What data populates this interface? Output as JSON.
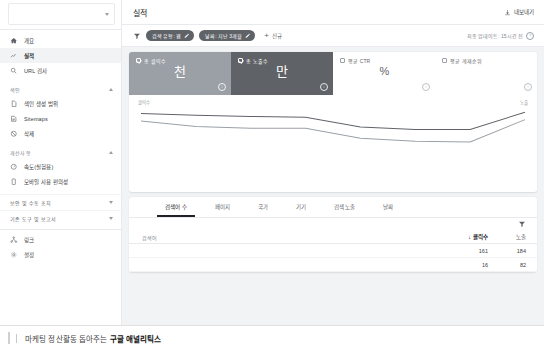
{
  "sidebar": {
    "property": {
      "name": "",
      "chevron_icon": "chevron-down-icon"
    },
    "primary_items": [
      {
        "label": "개요",
        "icon": "home-icon",
        "active": false
      },
      {
        "label": "실적",
        "icon": "performance-chart-icon",
        "active": true
      },
      {
        "label": "URL 검사",
        "icon": "search-inspect-icon",
        "active": false
      }
    ],
    "groups": [
      {
        "title": "색인",
        "expanded": true,
        "items": [
          {
            "label": "색인 생성 범위",
            "icon": "page-coverage-icon"
          },
          {
            "label": "Sitemaps",
            "icon": "sitemap-icon"
          },
          {
            "label": "삭제",
            "icon": "removal-icon"
          }
        ]
      },
      {
        "title": "개선사항",
        "expanded": true,
        "items": [
          {
            "label": "속도(실험용)",
            "icon": "speed-gauge-icon"
          },
          {
            "label": "모바일 사용 편의성",
            "icon": "mobile-device-icon"
          }
        ]
      }
    ],
    "collapsed_groups": [
      {
        "title": "보안 및 수동 조치",
        "icon": "chevron-down-icon"
      },
      {
        "title": "기존 도구 및 보고서",
        "icon": "chevron-down-icon"
      }
    ],
    "bottom_items": [
      {
        "label": "링크",
        "icon": "links-icon"
      },
      {
        "label": "설정",
        "icon": "gear-icon"
      }
    ]
  },
  "header": {
    "title": "실적",
    "export_label": "내보내기",
    "export_icon": "download-icon"
  },
  "filterbar": {
    "filter_icon": "filter-funnel-icon",
    "chips": [
      {
        "label": "검색 유형: 웹",
        "edit_icon": "pencil-icon"
      },
      {
        "label": "날짜: 지난 3개월",
        "edit_icon": "pencil-icon"
      }
    ],
    "new_label": "신규",
    "new_icon": "plus-icon",
    "updated_text": "최종 업데이트: 15시간 전",
    "info_icon": "info-icon",
    "info_glyph": "?"
  },
  "metrics": [
    {
      "label": "총 클릭수",
      "value": "천",
      "selected": true,
      "style": "light-gray",
      "info_icon": "info-icon"
    },
    {
      "label": "총 노출수",
      "value": "만",
      "selected": true,
      "style": "dark-gray",
      "info_icon": "info-icon"
    },
    {
      "label": "평균 CTR",
      "value": "%",
      "selected": false,
      "style": "white",
      "info_icon": "info-icon"
    },
    {
      "label": "평균 게재순위",
      "value": "",
      "selected": false,
      "style": "white",
      "info_icon": "info-icon"
    }
  ],
  "chart_data": {
    "type": "line",
    "title": "",
    "xlabel": "",
    "ylabel": "클릭수",
    "y2label": "노출",
    "legend_left": "클릭수",
    "legend_right": "노출",
    "grid": false,
    "x": [
      0,
      1,
      2,
      3,
      4,
      5,
      6,
      7
    ],
    "series": [
      {
        "name": "노출",
        "color": "#5f6368",
        "values": [
          88,
          85,
          83,
          82,
          66,
          62,
          62,
          90
        ]
      },
      {
        "name": "클릭수",
        "color": "#9aa0a6",
        "values": [
          76,
          67,
          64,
          64,
          48,
          43,
          42,
          78
        ]
      }
    ],
    "ylim": [
      0,
      100
    ]
  },
  "tabs": [
    {
      "label": "검색어 수",
      "active": true
    },
    {
      "label": "페이지",
      "active": false
    },
    {
      "label": "국가",
      "active": false
    },
    {
      "label": "기기",
      "active": false
    },
    {
      "label": "검색 노출",
      "active": false
    },
    {
      "label": "날짜",
      "active": false
    }
  ],
  "table": {
    "filter_icon": "filter-funnel-icon",
    "columns": {
      "query": "검색어",
      "clicks": "클릭수",
      "impressions": "노출"
    },
    "sort_icon": "sort-descending-arrow",
    "sort_glyph": "↓",
    "rows": [
      {
        "query": "",
        "clicks": "161",
        "impressions": "184"
      },
      {
        "query": "",
        "clicks": "16",
        "impressions": "82"
      }
    ]
  },
  "footer": {
    "caption_prefix": "마케팅 정산활동 돕아주는 ",
    "caption_emphasis": "구글 애널리틱스"
  }
}
